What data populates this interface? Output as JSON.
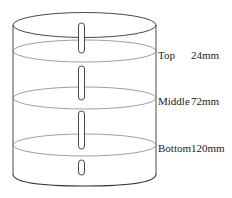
{
  "diagram": {
    "type": "cylinder-cross-section",
    "layers": [
      {
        "name": "Top",
        "depth": "24mm"
      },
      {
        "name": "Middle",
        "depth": "72mm"
      },
      {
        "name": "Bottom",
        "depth": "120mm"
      }
    ]
  }
}
